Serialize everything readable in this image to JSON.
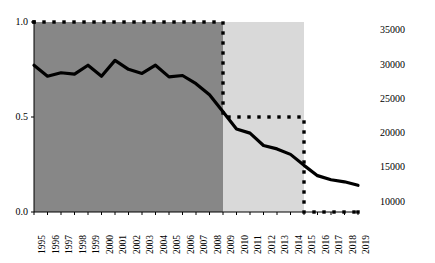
{
  "chart_data": {
    "type": "line",
    "title": "",
    "subtitle": "",
    "xlabel": "",
    "ylabel": "",
    "ylabel_right": "",
    "grid": false,
    "legend": "none",
    "x": [
      1995,
      1996,
      1997,
      1998,
      1999,
      2000,
      2001,
      2002,
      2003,
      2004,
      2005,
      2006,
      2007,
      2008,
      2009,
      2010,
      2011,
      2012,
      2013,
      2014,
      2015,
      2016,
      2017,
      2018,
      2019
    ],
    "xtick_labels": [
      "1995",
      "1996",
      "1997",
      "1998",
      "1999",
      "2000",
      "2001",
      "2002",
      "2003",
      "2004",
      "2005",
      "2006",
      "2007",
      "2008",
      "2009",
      "2010",
      "2011",
      "2012",
      "2013",
      "2014",
      "2015",
      "2016",
      "2017",
      "2018",
      "2019"
    ],
    "xtick_rotation": 90,
    "axis_left": {
      "ticks": [
        0.0,
        0.5,
        1.0
      ],
      "tick_labels": [
        "0.0",
        "0.5",
        "1.0"
      ],
      "ylim": [
        0.0,
        1.0
      ]
    },
    "axis_right": {
      "ticks": [
        10000,
        15000,
        20000,
        25000,
        30000,
        35000
      ],
      "tick_labels": [
        "10000",
        "15000",
        "20000",
        "25000",
        "30000",
        "35000"
      ],
      "ylim": [
        8500,
        36200
      ]
    },
    "series": [
      {
        "name": "step-proportion",
        "axis": "left",
        "style": "dotted",
        "marker": "square-dot",
        "color": "#000000",
        "values": [
          1.0,
          1.0,
          1.0,
          1.0,
          1.0,
          1.0,
          1.0,
          1.0,
          1.0,
          1.0,
          1.0,
          1.0,
          1.0,
          1.0,
          0.5,
          0.5,
          0.5,
          0.5,
          0.5,
          0.5,
          0.0,
          0.0,
          0.0,
          0.0,
          0.0
        ]
      },
      {
        "name": "count-line",
        "axis": "right",
        "style": "solid",
        "color": "#000000",
        "values": [
          29900,
          28300,
          28800,
          28600,
          29900,
          28300,
          30600,
          29300,
          28700,
          29900,
          28200,
          28400,
          27200,
          25600,
          23100,
          20600,
          20000,
          18200,
          17700,
          16900,
          15300,
          13800,
          13200,
          12900,
          12400
        ]
      }
    ],
    "shaded_bands": [
      {
        "name": "dark-band",
        "from": 1995,
        "to": 2009,
        "color": "#878787"
      },
      {
        "name": "light-band",
        "from": 2009,
        "to": 2015,
        "color": "#d9d9d9"
      }
    ]
  }
}
